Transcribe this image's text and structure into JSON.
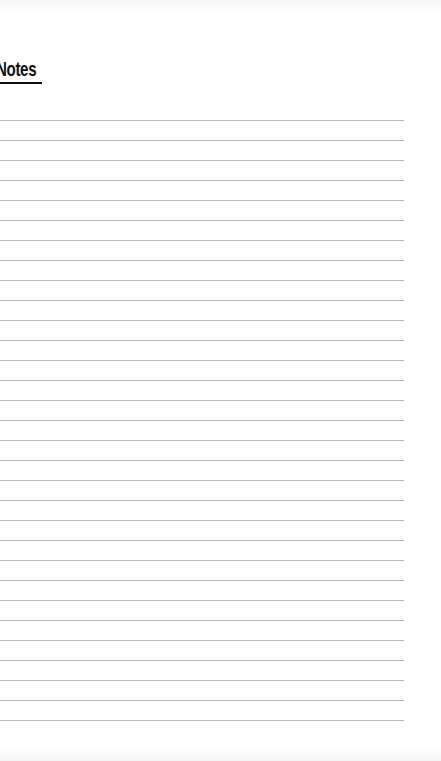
{
  "page": {
    "heading": "Notes",
    "ruled_line_count": 31,
    "ruled_line_start_y": 120,
    "ruled_line_spacing": 20,
    "ruled_line_color": "#b8b8b8",
    "heading_color": "#111111"
  }
}
